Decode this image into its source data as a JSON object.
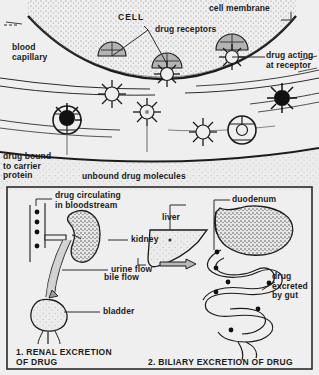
{
  "title": "DRUG ACTION AND EXCRETION",
  "upper_panel": {
    "name": "drug-action-at-cell",
    "labels": {
      "cell": "CELL",
      "cell_membrane": "cell membrane",
      "drug_receptors": "drug receptors",
      "blood_capillary": "blood\ncapillary",
      "drug_acting_at_receptor": "drug acting\nat receptor",
      "drug_bound_to_carrier_protein": "drug bound\nto carrier\nprotein",
      "unbound_drug_molecules": "unbound drug molecules"
    }
  },
  "lower_panel": {
    "renal": {
      "caption": "1.  RENAL EXCRETION\n     OF DRUG",
      "labels": {
        "drug_circulating": "drug circulating\nin bloodstream",
        "kidney": "kidney",
        "urine_flow": "urine flow",
        "bladder": "bladder"
      }
    },
    "biliary": {
      "caption": "2.  BILIARY EXCRETION OF DRUG",
      "labels": {
        "liver": "liver",
        "bile_flow": "bile flow",
        "duodenum": "duodenum",
        "drug_excreted_by_gut": "drug\nexcreted\nby gut"
      }
    }
  },
  "colors": {
    "background": "#efefef",
    "ink": "#1b1b1b",
    "receptor_fill": "#b3b3b3",
    "organ_fill": "#d8d8d8",
    "panel_border": "#2a2a2a"
  }
}
